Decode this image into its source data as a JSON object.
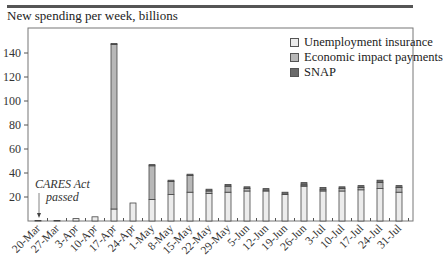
{
  "title": "New spending per week, billions",
  "legend": [
    {
      "label": "Unemployment insurance",
      "color": "#ececec"
    },
    {
      "label": "Economic impact payments",
      "color": "#b8b8b8"
    },
    {
      "label": "SNAP",
      "color": "#6a6a6a"
    }
  ],
  "annotation": {
    "line1": "CARES Act",
    "line2": "passed"
  },
  "chart_data": {
    "type": "bar",
    "stacked": true,
    "title": "New spending per week, billions",
    "xlabel": "",
    "ylabel": "",
    "ylim": [
      0,
      150
    ],
    "yticks": [
      20,
      40,
      60,
      80,
      100,
      120,
      140
    ],
    "grid": false,
    "legend_position": "upper right",
    "categories": [
      "20-Mar",
      "27-Mar",
      "3-Apr",
      "10-Apr",
      "17-Apr",
      "24-Apr",
      "1-May",
      "8-May",
      "15-May",
      "22-May",
      "29-May",
      "5-Jun",
      "12-Jun",
      "19-Jun",
      "26-Jun",
      "3-Jul",
      "10-Jul",
      "17-Jul",
      "24-Jul",
      "31-Jul"
    ],
    "series": [
      {
        "name": "Unemployment insurance",
        "values": [
          0.5,
          0.5,
          2,
          3.5,
          10,
          15,
          18,
          22,
          24,
          23,
          24,
          25,
          25,
          22,
          29,
          25,
          25,
          26,
          27,
          24
        ]
      },
      {
        "name": "Economic impact payments",
        "values": [
          0,
          0,
          0,
          0,
          137,
          0,
          28,
          11,
          14,
          2,
          5,
          2,
          0,
          0,
          1,
          1,
          2,
          2,
          5,
          4
        ]
      },
      {
        "name": "SNAP",
        "values": [
          0,
          0,
          0,
          0,
          1,
          0,
          1,
          1,
          1,
          1.5,
          1.5,
          1.5,
          2,
          2,
          2,
          2,
          1.5,
          1.5,
          2,
          1.5
        ]
      }
    ],
    "annotations": [
      {
        "text": "CARES Act passed",
        "x": "20-Mar"
      }
    ]
  }
}
